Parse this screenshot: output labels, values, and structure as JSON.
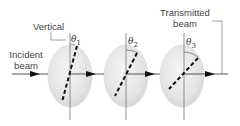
{
  "figure": {
    "labels": {
      "vertical": "Vertical",
      "incident_line1": "Incident",
      "incident_line2": "beam",
      "transmitted_line1": "Transmitted",
      "transmitted_line2": "beam"
    },
    "angles": [
      {
        "symbol": "θ",
        "index": "1"
      },
      {
        "symbol": "θ",
        "index": "2"
      },
      {
        "symbol": "θ",
        "index": "3"
      }
    ],
    "colors": {
      "disk_fill": "#e8e8e8",
      "disk_edge": "#d0d0d0",
      "line": "#555555",
      "axis_dash": "#111111"
    }
  }
}
